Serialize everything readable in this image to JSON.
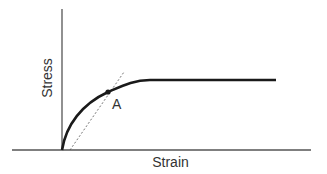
{
  "diagram": {
    "type": "stress-strain curve",
    "x_axis_label": "Strain",
    "y_axis_label": "Stress",
    "point_label": "A",
    "colors": {
      "axis": "#555555",
      "curve": "#1a1a1a",
      "tangent": "#555555",
      "text": "#333333"
    },
    "elements": [
      {
        "name": "stress-strain-curve",
        "style": "solid thick",
        "description": "rises steeply from origin, bends at point A, then plateaus horizontally"
      },
      {
        "name": "tangent-line",
        "style": "dashed",
        "description": "line through point A from near origin"
      },
      {
        "name": "point-a",
        "style": "filled dot"
      }
    ]
  }
}
